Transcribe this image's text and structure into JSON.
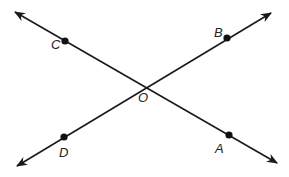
{
  "diagram": {
    "colors": {
      "line": "#1a1a1a",
      "point": "#111111",
      "label": "#222222"
    },
    "lines": [
      {
        "name": "line-CA",
        "from": [
          15,
          12
        ],
        "to": [
          277,
          163
        ],
        "arrows": "both"
      },
      {
        "name": "line-DB",
        "from": [
          17,
          166
        ],
        "to": [
          271,
          13
        ],
        "arrows": "both"
      }
    ],
    "points": [
      {
        "id": "C",
        "label": "C",
        "x": 65,
        "y": 41,
        "dot": true,
        "lx": 51,
        "ly": 49
      },
      {
        "id": "B",
        "label": "B",
        "x": 227,
        "y": 38,
        "dot": true,
        "lx": 214,
        "ly": 37
      },
      {
        "id": "D",
        "label": "D",
        "x": 64,
        "y": 137,
        "dot": true,
        "lx": 59,
        "ly": 157
      },
      {
        "id": "A",
        "label": "A",
        "x": 229,
        "y": 135,
        "dot": true,
        "lx": 215,
        "ly": 153
      },
      {
        "id": "O",
        "label": "O",
        "x": 145,
        "y": 86,
        "dot": false,
        "lx": 138,
        "ly": 102
      }
    ]
  }
}
